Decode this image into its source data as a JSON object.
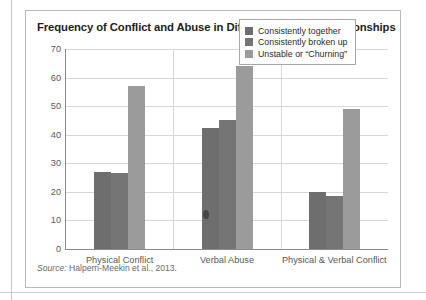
{
  "card": {
    "title": "Frequency of Conflict and Abuse in Different Types of Relationships",
    "source_keyword": "Source:",
    "source_text": " Halpern-Meekin et al., 2013."
  },
  "chart_data": {
    "type": "bar",
    "title": "Frequency of Conflict and Abuse in Different Types of Relationships",
    "xlabel": "",
    "ylabel": "",
    "ylim": [
      0,
      70
    ],
    "yticks": [
      0,
      10,
      20,
      30,
      40,
      50,
      60,
      70
    ],
    "grid": "horizontal-and-category-separators",
    "legend_position": "top-right-inside",
    "categories": [
      "Physical Conflict",
      "Verbal Abuse",
      "Physical & Verbal Conflict"
    ],
    "series": [
      {
        "name": "Consistently together",
        "color": "#6e6e6e",
        "values": [
          27,
          42.5,
          20
        ]
      },
      {
        "name": "Consistently broken up",
        "color": "#757575",
        "values": [
          26.5,
          45,
          18.5
        ]
      },
      {
        "name": "Unstable or “Churning”",
        "color": "#9b9b9b",
        "values": [
          57,
          64,
          49
        ]
      }
    ]
  }
}
